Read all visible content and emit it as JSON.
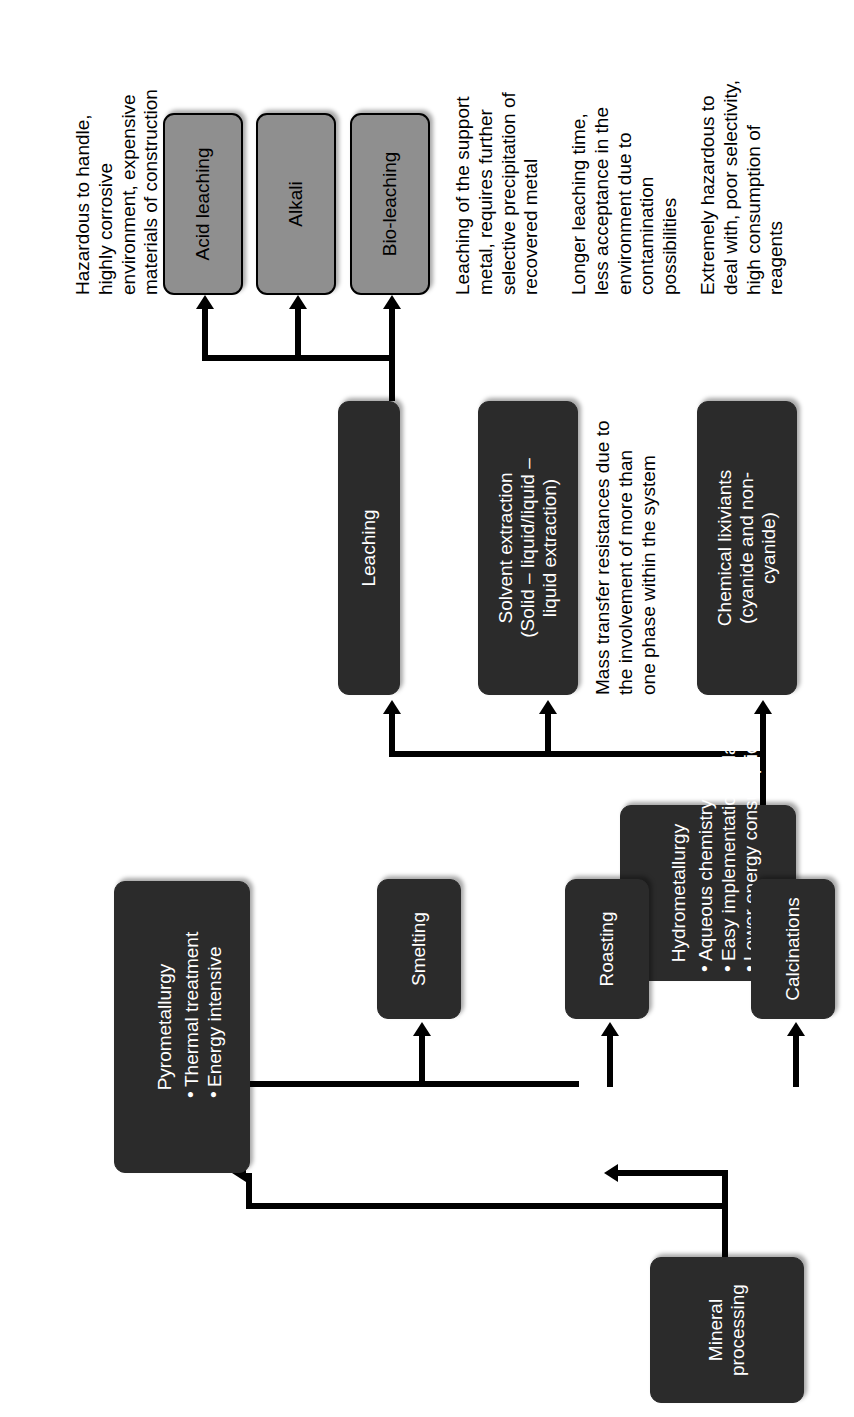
{
  "diagram": {
    "colors": {
      "dark_node": "#2b2b2b",
      "gray_node": "#8f8f8f",
      "connector": "#000000",
      "background": "#ffffff"
    },
    "nodes": {
      "mineral_processing": {
        "label": "Mineral\nprocessing"
      },
      "pyrometallurgy": {
        "title": "Pyrometallurgy",
        "bullets": [
          "Thermal treatment",
          "Energy intensive"
        ]
      },
      "hydrometallurgy": {
        "title": "Hydrometallurgy",
        "bullets": [
          "Aqueous chemistry",
          "Easy implementation in lab,",
          "Lower energy consumption"
        ]
      },
      "calcinations": {
        "label": "Calcinations"
      },
      "roasting": {
        "label": "Roasting"
      },
      "smelting": {
        "label": "Smelting"
      },
      "leaching": {
        "label": "Leaching"
      },
      "solvent_extraction": {
        "label": "Solvent extraction\n(Solid – liquid/liquid –\nliquid extraction)"
      },
      "chemical_lixiviants": {
        "label": "Chemical lixiviants\n(cyanide and non-\ncyanide)"
      },
      "acid_leaching": {
        "label": "Acid leaching"
      },
      "alkali": {
        "label": "Alkali"
      },
      "bio_leaching": {
        "label": "Bio-leaching"
      }
    },
    "notes": {
      "pyro_note": "Highly energy intensive, may liberate toxic gases to the environment.",
      "acid_note": "Hazardous to handle,\nhighly corrosive\nenvironment, expensive\nmaterials of construction",
      "alkali_note": "Leaching of the support\nmetal, requires further\nselective precipitation of\nrecovered metal",
      "bio_note": "Longer leaching time,\nless acceptance in the\nenvironment due to\ncontamination\npossibilities",
      "solvent_note": "Mass transfer resistances due to\nthe involvement of more than\none phase within the system",
      "lixiviant_note": "Extremely hazardous to\ndeal with, poor selectivity,\nhigh consumption of\nreagents"
    }
  }
}
